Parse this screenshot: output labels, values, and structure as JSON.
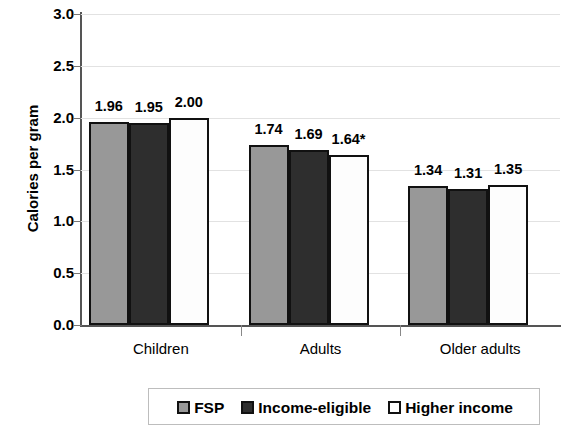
{
  "chart_data": {
    "type": "bar",
    "title": "",
    "xlabel": "",
    "ylabel": "Calories per gram",
    "categories": [
      "Children",
      "Adults",
      "Older adults"
    ],
    "series": [
      {
        "name": "FSP",
        "values": [
          1.96,
          1.74,
          1.34
        ],
        "color": "#989898",
        "labels": [
          "1.96",
          "1.74",
          "1.34"
        ]
      },
      {
        "name": "Income-eligible",
        "values": [
          1.95,
          1.69,
          1.31
        ],
        "color": "#2e2e2e",
        "labels": [
          "1.95",
          "1.69",
          "1.31"
        ]
      },
      {
        "name": "Higher income",
        "values": [
          2.0,
          1.64,
          1.35
        ],
        "color": "#ffffff",
        "labels": [
          "2.00",
          "1.64*",
          "1.35"
        ]
      }
    ],
    "ylim": [
      0.0,
      3.0
    ],
    "ytick_labels": [
      "3.0",
      "2.5",
      "2.0",
      "1.5",
      "1.0",
      "0.5",
      "0.0"
    ],
    "ytick_values": [
      3.0,
      2.5,
      2.0,
      1.5,
      1.0,
      0.5,
      0.0
    ],
    "grid": true,
    "legend_position": "bottom",
    "annotations": [
      "*"
    ]
  },
  "axis": {
    "y_title": "Calories per gram"
  },
  "legend": {
    "items": [
      {
        "label": "FSP",
        "swatch": "gray-square-swatch"
      },
      {
        "label": "Income-eligible",
        "swatch": "dark-square-swatch"
      },
      {
        "label": "Higher income",
        "swatch": "white-square-swatch"
      }
    ]
  }
}
